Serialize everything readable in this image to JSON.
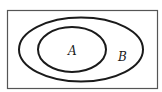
{
  "diagram": {
    "type": "venn",
    "universe": {
      "label": ""
    },
    "sets": [
      {
        "id": "B",
        "label": "B"
      },
      {
        "id": "A",
        "label": "A"
      }
    ],
    "colors": {
      "stroke": "#1a1a1a",
      "background": "#ffffff",
      "frame": "#555555"
    }
  }
}
